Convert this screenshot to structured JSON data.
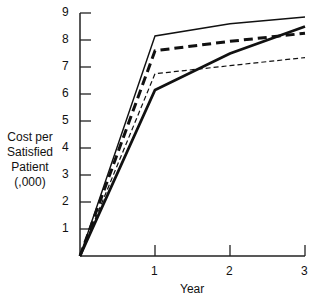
{
  "chart_data": {
    "type": "line",
    "title": "",
    "xlabel": "Year",
    "ylabel": "Cost per Satisfied Patient (,000)",
    "ylabel_lines": [
      "Cost per",
      "Satisfied",
      "Patient",
      "(,000)"
    ],
    "x": [
      0,
      1,
      2,
      3
    ],
    "x_tick_labels": [
      "1",
      "2",
      "3"
    ],
    "y_tick_labels": [
      "1",
      "2",
      "3",
      "4",
      "5",
      "6",
      "7",
      "8",
      "9"
    ],
    "xlim": [
      0,
      3
    ],
    "ylim": [
      0,
      9
    ],
    "grid": false,
    "legend": "none",
    "series": [
      {
        "name": "thin solid",
        "style": "thin-solid",
        "values": [
          0,
          8.15,
          8.6,
          8.85
        ]
      },
      {
        "name": "thick dashed",
        "style": "thick-dashed",
        "values": [
          0,
          7.6,
          7.95,
          8.25
        ]
      },
      {
        "name": "thin dashed",
        "style": "thin-dashed",
        "values": [
          0,
          6.75,
          7.05,
          7.35
        ]
      },
      {
        "name": "thick solid",
        "style": "thick-solid",
        "values": [
          0,
          6.15,
          7.5,
          8.5
        ]
      }
    ]
  }
}
